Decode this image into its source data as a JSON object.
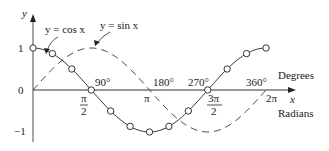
{
  "chart_data": {
    "type": "line",
    "title": "",
    "xlabel": "x",
    "ylabel": "y",
    "x_unit_labels": {
      "top": "Degrees",
      "bottom": "Radians"
    },
    "xlim_radians": [
      0,
      6.2832
    ],
    "ylim": [
      -1,
      1
    ],
    "y_ticks": [
      {
        "value": 1,
        "label": "1"
      },
      {
        "value": 0,
        "label": "0"
      },
      {
        "value": -1,
        "label": "−1"
      }
    ],
    "x_ticks_degrees": [
      {
        "value": 90,
        "label": "90°"
      },
      {
        "value": 180,
        "label": "180°"
      },
      {
        "value": 270,
        "label": "270°"
      },
      {
        "value": 360,
        "label": "360°"
      }
    ],
    "x_ticks_radians": [
      {
        "value": 1.5708,
        "label_num": "π",
        "label_den": "2"
      },
      {
        "value": 3.1416,
        "label": "π"
      },
      {
        "value": 4.7124,
        "label_num": "3π",
        "label_den": "2"
      },
      {
        "value": 6.2832,
        "label": "2π"
      }
    ],
    "series": [
      {
        "name": "y = cos x",
        "style": "solid with circle markers",
        "x_degrees": [
          0,
          30,
          60,
          90,
          120,
          150,
          180,
          210,
          240,
          270,
          300,
          330,
          360
        ],
        "values": [
          1,
          0.866,
          0.5,
          0,
          -0.5,
          -0.866,
          -1,
          -0.866,
          -0.5,
          0,
          0.5,
          0.866,
          1
        ]
      },
      {
        "name": "y = sin x",
        "style": "dashed",
        "x_degrees": [
          0,
          30,
          60,
          90,
          120,
          150,
          180,
          210,
          240,
          270,
          300,
          330,
          360
        ],
        "values": [
          0,
          0.5,
          0.866,
          1,
          0.866,
          0.5,
          0,
          -0.5,
          -0.866,
          -1,
          -0.866,
          -0.5,
          0
        ]
      }
    ],
    "annotations": [
      {
        "text": "y = cos x",
        "points_to": "cos curve near x=30°"
      },
      {
        "text": "y = sin x",
        "points_to": "sin curve peak at x=90°"
      }
    ],
    "grid": false,
    "legend": "none (inline annotations)"
  },
  "labels": {
    "y_axis": "y",
    "x_axis": "x",
    "degrees": "Degrees",
    "radians": "Radians",
    "cos_label": "y = cos x",
    "sin_label": "y = sin x",
    "y1": "1",
    "y0": "0",
    "ym1": "−1",
    "deg90": "90°",
    "deg180": "180°",
    "deg270": "270°",
    "deg360": "360°",
    "pi_half_num": "π",
    "pi_half_den": "2",
    "pi": "π",
    "three_pi_half_num": "3π",
    "three_pi_half_den": "2",
    "two_pi": "2π"
  }
}
